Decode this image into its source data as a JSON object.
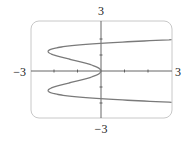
{
  "chart_data": {
    "type": "line",
    "title": "",
    "equation": "x = y^4 - 3y^2",
    "xlabel": "",
    "ylabel": "",
    "xlim": [
      -3,
      3
    ],
    "ylim": [
      -3,
      3
    ],
    "x_tick_step": 1,
    "y_tick_step": 1,
    "grid": false,
    "axis_labels": {
      "left": "−3",
      "right": "3",
      "top": "3",
      "bottom": "−3"
    },
    "series": [
      {
        "name": "curve",
        "parametric": "x = y^4 - 3y^2",
        "points": [
          {
            "x": 3.0,
            "y": -1.95
          },
          {
            "x": 0.0,
            "y": -1.73
          },
          {
            "x": -2.25,
            "y": -1.22
          },
          {
            "x": -1.0,
            "y": -0.62
          },
          {
            "x": 0.0,
            "y": 0.0
          },
          {
            "x": -1.0,
            "y": 0.62
          },
          {
            "x": -2.25,
            "y": 1.22
          },
          {
            "x": 0.0,
            "y": 1.73
          },
          {
            "x": 3.0,
            "y": 1.95
          }
        ]
      }
    ],
    "colors": {
      "curve": "#7a7a7a",
      "axes": "#555555",
      "frame": "#c8c8c8"
    }
  }
}
